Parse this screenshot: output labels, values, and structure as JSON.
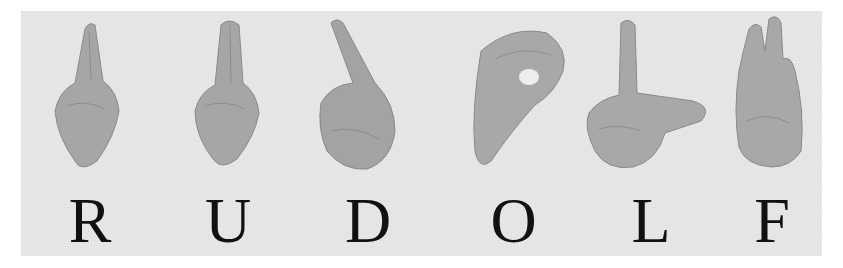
{
  "figure": {
    "word": "RUDOLF",
    "background_color": "#e6e6e6",
    "skin_color": "#a8a8a8",
    "letters": [
      {
        "letter": "R",
        "handshape": "index and middle fingers crossed, pointing up"
      },
      {
        "letter": "U",
        "handshape": "index and middle fingers together, pointing up"
      },
      {
        "letter": "D",
        "handshape": "index finger pointing up, other fingers touching thumb"
      },
      {
        "letter": "O",
        "handshape": "all fingers curved to touch thumb forming a circle"
      },
      {
        "letter": "L",
        "handshape": "index finger up, thumb extended sideways"
      },
      {
        "letter": "F",
        "handshape": "index touches thumb, other three fingers up"
      }
    ]
  }
}
